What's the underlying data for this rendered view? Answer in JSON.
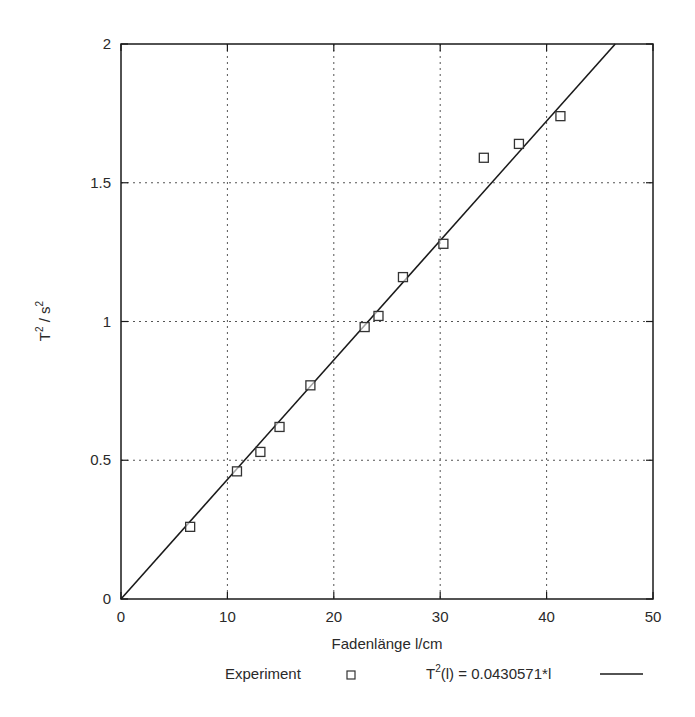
{
  "chart_data": {
    "type": "scatter",
    "title": "",
    "xlabel": "Fadenlänge l/cm",
    "ylabel": "T² / s²",
    "xlim": [
      0,
      50
    ],
    "ylim": [
      0,
      2
    ],
    "xticks": [
      0,
      10,
      20,
      30,
      40,
      50
    ],
    "yticks": [
      0,
      0.5,
      1,
      1.5,
      2
    ],
    "xtick_labels": [
      "0",
      "10",
      "20",
      "30",
      "40",
      "50"
    ],
    "ytick_labels": [
      "0",
      "0.5",
      "1",
      "1.5",
      "2"
    ],
    "grid": true,
    "legend_position": "bottom",
    "series": [
      {
        "name": "Experiment",
        "type": "scatter",
        "marker": "open-square",
        "x": [
          6.5,
          10.9,
          13.1,
          14.9,
          17.8,
          22.9,
          24.2,
          26.5,
          30.3,
          34.1,
          37.4,
          41.3
        ],
        "y": [
          0.26,
          0.46,
          0.53,
          0.62,
          0.77,
          0.98,
          1.02,
          1.16,
          1.28,
          1.59,
          1.64,
          1.74
        ]
      },
      {
        "name": "T²(l) = 0.0430571*l",
        "type": "line",
        "slope": 0.0430571,
        "intercept": 0,
        "x": [
          0,
          46.45
        ],
        "y": [
          0,
          2
        ]
      }
    ]
  },
  "axes": {
    "xlabel": "Fadenlänge l/cm",
    "ylabel_base": "T",
    "ylabel_sup1": "2",
    "ylabel_mid": " / s",
    "ylabel_sup2": "2"
  },
  "legend": {
    "experiment_label": "Experiment",
    "fit_label_base": "T",
    "fit_label_sup": "2",
    "fit_label_rest": "(l) = 0.0430571*l"
  },
  "colors": {
    "axis": "#1a1a1a",
    "grid": "#555555",
    "line": "#1a1a1a",
    "marker": "#333333"
  }
}
